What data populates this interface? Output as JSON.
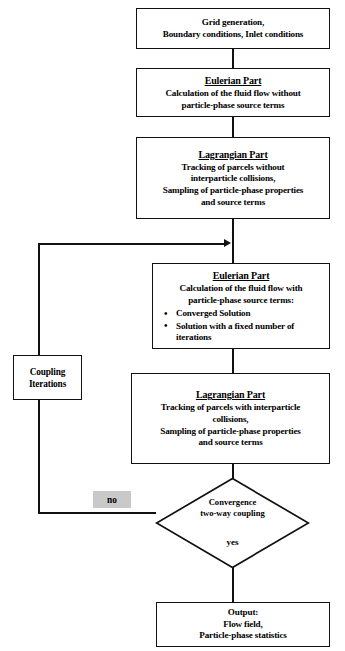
{
  "diagram": {
    "nodes": {
      "start": {
        "lines": [
          "Grid generation,",
          "Boundary conditions, Inlet conditions"
        ]
      },
      "eulerian_first": {
        "title": "Eulerian Part",
        "lines": [
          "Calculation of the fluid flow without",
          "particle-phase source terms"
        ]
      },
      "lagrangian_first": {
        "title": "Lagrangian Part",
        "lines": [
          "Tracking of parcels without",
          "interparticle collisions,",
          "Sampling of particle-phase properties",
          "and source terms"
        ]
      },
      "eulerian_second": {
        "title": "Eulerian Part",
        "lines": [
          "Calculation of the fluid flow with",
          "particle-phase source terms:"
        ],
        "bullets": [
          "Converged Solution",
          "Solution with a fixed number of iterations"
        ]
      },
      "lagrangian_second": {
        "title": "Lagrangian Part",
        "lines": [
          "Tracking of parcels with interparticle",
          "collisions,",
          "Sampling of particle-phase properties",
          "and source terms"
        ]
      },
      "coupling": {
        "lines": [
          "Coupling",
          "Iterations"
        ]
      },
      "decision": {
        "lines": [
          "Convergence",
          "two-way coupling"
        ],
        "yes_label": "yes",
        "no_label": "no"
      },
      "output": {
        "lines": [
          "Output:",
          "Flow field,",
          "Particle-phase statistics"
        ]
      }
    },
    "colors": {
      "stroke": "#111111",
      "background": "#ffffff",
      "highlight": "#c9c9c9"
    }
  }
}
